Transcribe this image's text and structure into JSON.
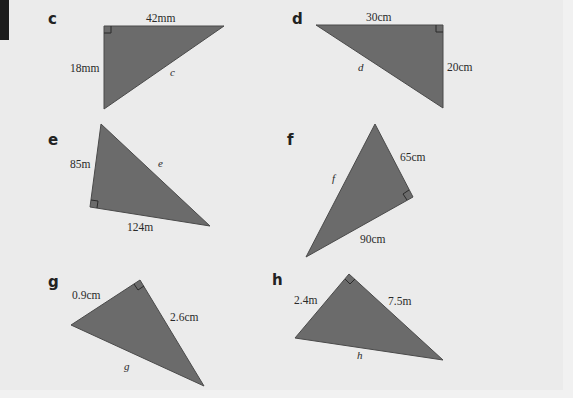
{
  "problems": [
    {
      "id": "c",
      "label": "c",
      "sides": [
        "42mm",
        "18mm"
      ],
      "unknown": "c"
    },
    {
      "id": "d",
      "label": "d",
      "sides": [
        "30cm",
        "20cm"
      ],
      "unknown": "d"
    },
    {
      "id": "e",
      "label": "e",
      "sides": [
        "85m",
        "124m"
      ],
      "unknown": "e"
    },
    {
      "id": "f",
      "label": "f",
      "sides": [
        "65cm",
        "90cm"
      ],
      "unknown": "f"
    },
    {
      "id": "g",
      "label": "g",
      "sides": [
        "0.9cm",
        "2.6cm"
      ],
      "unknown": "g"
    },
    {
      "id": "h",
      "label": "h",
      "sides": [
        "2.4m",
        "7.5m"
      ],
      "unknown": "h"
    }
  ],
  "colors": {
    "triangle_fill": "#6b6b6b",
    "background": "#ebebeb"
  }
}
